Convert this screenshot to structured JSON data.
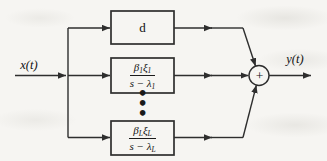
{
  "diagram": {
    "input_label": "x(t)",
    "output_label": "y(t)",
    "sum_symbol": "+",
    "ellipsis_dots": "•\n•\n•",
    "blocks": {
      "feedthrough": {
        "label": "d"
      },
      "mode1": {
        "num_beta": "β",
        "num_beta_sub": "1",
        "num_xi": "ξ",
        "num_xi_sub": "1",
        "den_main": "s − λ",
        "den_sub": "1"
      },
      "modeL": {
        "num_beta": "β",
        "num_beta_sub": "L",
        "num_xi": "ξ",
        "num_xi_sub": "L",
        "den_main": "s − λ",
        "den_sub": "L"
      }
    },
    "icons": {
      "ellipsis": "vertical-ellipsis",
      "sum": "summing-junction"
    },
    "colors": {
      "stroke": "#2e2e2e",
      "text": "#111111",
      "background": "#f6f5f2"
    }
  }
}
